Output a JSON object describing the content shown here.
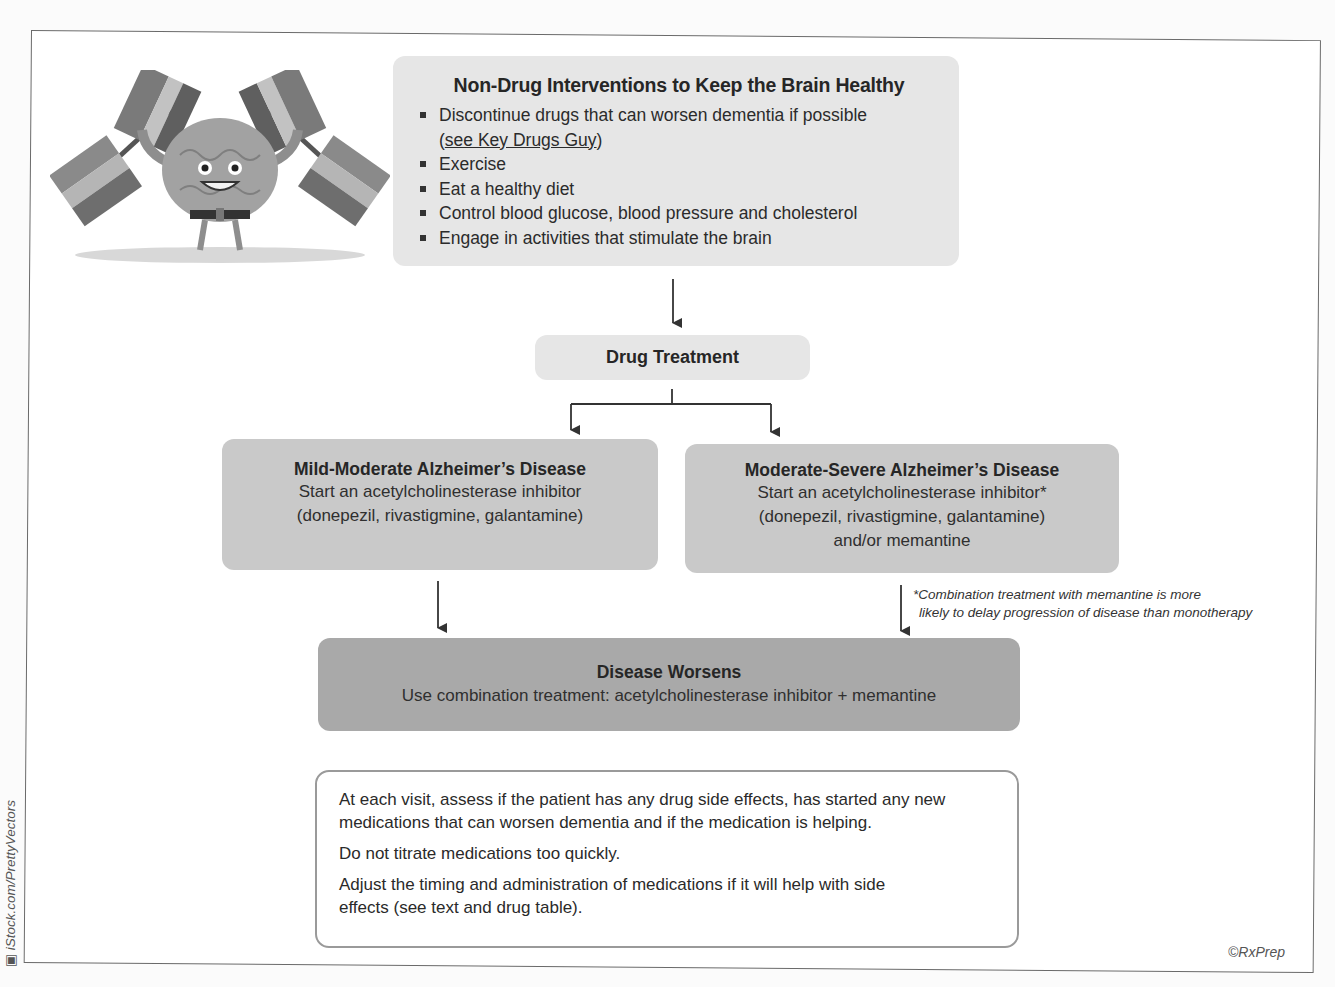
{
  "non_drug": {
    "title": "Non-Drug Interventions to Keep the Brain Healthy",
    "items": [
      {
        "text": "Discontinue drugs that can worsen dementia if possible",
        "link": "see Key Drugs Guy"
      },
      {
        "text": "Exercise"
      },
      {
        "text": "Eat a healthy diet"
      },
      {
        "text": "Control blood glucose, blood pressure and cholesterol"
      },
      {
        "text": "Engage in activities that stimulate the brain"
      }
    ]
  },
  "drug_treatment": {
    "title": "Drug Treatment"
  },
  "mild_moderate": {
    "title": "Mild-Moderate Alzheimer’s Disease",
    "line1": "Start an acetylcholinesterase inhibitor",
    "line2": "(donepezil, rivastigmine, galantamine)"
  },
  "moderate_severe": {
    "title": "Moderate-Severe Alzheimer’s Disease",
    "line1": "Start an acetylcholinesterase inhibitor*",
    "line2": "(donepezil, rivastigmine, galantamine)",
    "line3": "and/or memantine"
  },
  "footnote": {
    "line1": "*Combination treatment with memantine is more",
    "line2": "likely to delay progression of disease than monotherapy"
  },
  "disease_worsens": {
    "title": "Disease Worsens",
    "line1": "Use combination treatment: acetylcholinesterase inhibitor + memantine"
  },
  "monitoring": {
    "paragraphs": [
      "At each visit, assess if the patient has any drug side effects, has started any new medications that can worsen dementia and if the medication is helping.",
      "Do not titrate medications too quickly.",
      "Adjust the timing and administration of medications if it will help with side effects (see text and drug table)."
    ]
  },
  "copyright": "©RxPrep",
  "image_credit": "iStock.com/PrettyVectors",
  "colors": {
    "box_light": "#e6e6e6",
    "box_mid": "#c9c9c9",
    "box_dark": "#a9a9a9",
    "arrow": "#333333"
  }
}
